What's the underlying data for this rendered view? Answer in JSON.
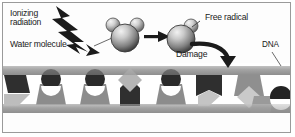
{
  "figure": {
    "kind": "science-diagram",
    "background_color": "#ffffff",
    "border_color": "#9a9a9a"
  },
  "labels": {
    "ionizing_radiation": "Ionizing\nradiation",
    "ionizing_radiation_line1": "Ionizing",
    "ionizing_radiation_line2": "radiation",
    "water_molecule": "Water molecule",
    "free_radical": "Free radical",
    "damage": "Damage",
    "dna": "DNA"
  },
  "icons": {
    "lightning_bolt": "lightning-bolt-arrow-icon",
    "straight_arrow": "right-arrow-icon",
    "curved_arrow": "curved-down-arrow-icon",
    "water_molecule": "water-molecule-icon",
    "free_radical": "free-radical-icon",
    "burst": "radial-burst-icon",
    "dna_strand": "dna-strand-icon"
  },
  "palette": {
    "ink": "#1a1a1a",
    "rail_gray": "#9d9d9d",
    "rail_gray_light": "#b8b8b8",
    "base_dark": "#2f2f2f",
    "base_mid": "#8c8c8c",
    "base_light": "#cfcfcf",
    "sphere_dark": "#3a3a3a",
    "sphere_mid": "#8a8a8a",
    "sphere_light": "#e6e6e6",
    "leader_line": "#6a6a6a",
    "burst_white": "#ffffff"
  },
  "dna": {
    "rail_count": 2,
    "band_top_y": 66,
    "band_bottom_y": 112,
    "base_count": 9,
    "bases": [
      {
        "index": 0,
        "orientation": "down",
        "cap": "wedge",
        "shade": "dark"
      },
      {
        "index": 1,
        "orientation": "up",
        "cap": "circle",
        "shade": "mid"
      },
      {
        "index": 2,
        "orientation": "up",
        "cap": "circle",
        "shade": "mid"
      },
      {
        "index": 3,
        "orientation": "down",
        "cap": "diamond",
        "shade": "dark"
      },
      {
        "index": 4,
        "orientation": "up",
        "cap": "circle",
        "shade": "mid"
      },
      {
        "index": 5,
        "orientation": "down",
        "cap": "wedge",
        "shade": "dark"
      },
      {
        "index": 6,
        "orientation": "down",
        "cap": "diamond",
        "shade": "light"
      },
      {
        "index": 7,
        "orientation": "up",
        "cap": "wedge",
        "shade": "mid"
      },
      {
        "index": 8,
        "orientation": "up",
        "cap": "circle",
        "shade": "dark"
      }
    ]
  },
  "molecules": {
    "water": {
      "label": "Water molecule",
      "large_spheres": 1,
      "small_spheres": 2
    },
    "radical": {
      "label": "Free radical",
      "large_spheres": 1,
      "small_spheres": 1
    }
  }
}
